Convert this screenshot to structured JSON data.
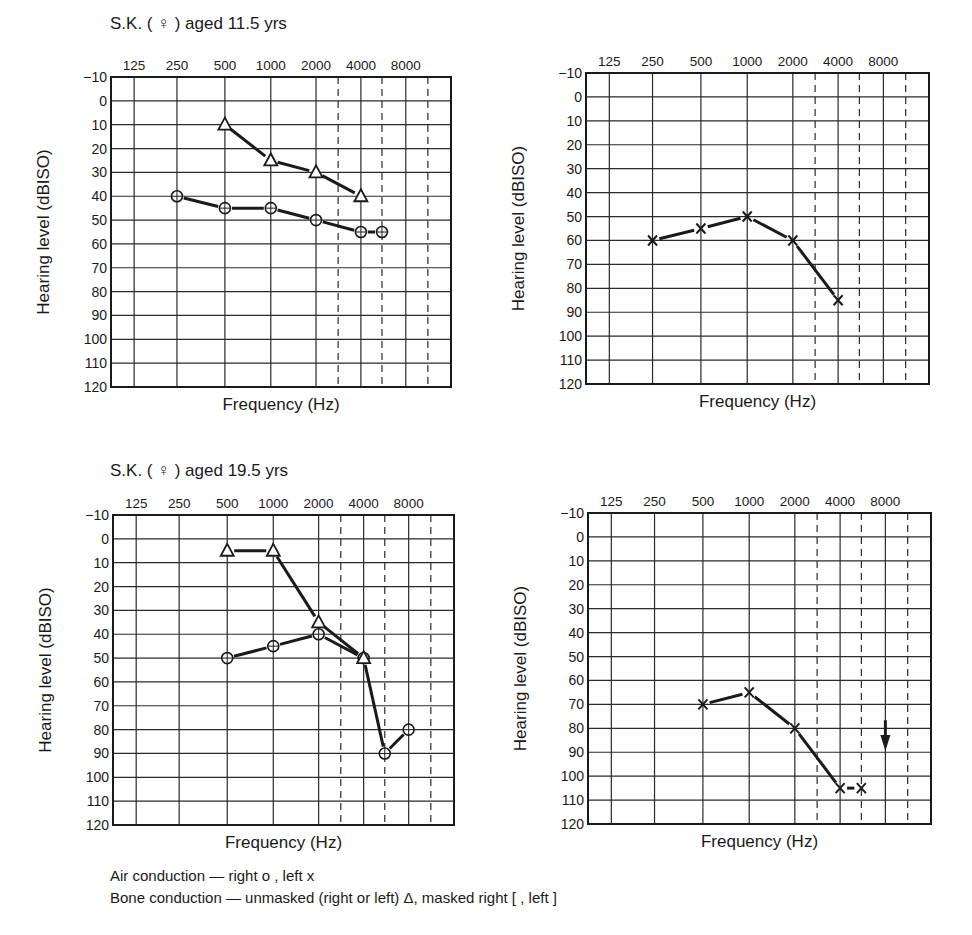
{
  "panels_title": {
    "top": "S.K. ( ♀ ) aged 11.5 yrs",
    "bottom": "S.K. ( ♀ ) aged 19.5 yrs"
  },
  "legend": {
    "air": "Air conduction — right ο , left x",
    "bone": "Bone conduction — unmasked (right or left) Δ, masked right [ , left ]"
  },
  "cutoff_text": "",
  "colors": {
    "ink": "#1a1a1a",
    "grid": "#2a2a2a",
    "background": "#ffffff"
  },
  "chart_data": [
    {
      "type": "line",
      "title": "S.K. (♀) aged 11.5 yrs — right ear",
      "xlabel": "Frequency (Hz)",
      "ylabel": "Hearing level (dBISO)",
      "x_tick_labels": [
        "125",
        "250",
        "500",
        "1000",
        "2000",
        "4000",
        "8000"
      ],
      "y_ticks": [
        -10,
        0,
        10,
        20,
        30,
        40,
        50,
        60,
        70,
        80,
        90,
        100,
        110,
        120
      ],
      "ylim": [
        -10,
        120
      ],
      "y_inverted": true,
      "grid": true,
      "series": [
        {
          "name": "Air conduction right (o)",
          "marker": "circle",
          "x": [
            250,
            500,
            1000,
            2000,
            4000,
            6000
          ],
          "values": [
            40,
            45,
            45,
            50,
            55,
            55
          ]
        },
        {
          "name": "Bone conduction unmasked (Δ)",
          "marker": "triangle",
          "x": [
            500,
            1000,
            2000,
            4000
          ],
          "values": [
            10,
            25,
            30,
            40
          ]
        }
      ]
    },
    {
      "type": "line",
      "title": "S.K. (♀) aged 11.5 yrs — left ear",
      "xlabel": "Frequency (Hz)",
      "ylabel": "Hearing level (dBISO)",
      "x_tick_labels": [
        "125",
        "250",
        "500",
        "1000",
        "2000",
        "4000",
        "8000"
      ],
      "y_ticks": [
        -10,
        0,
        10,
        20,
        30,
        40,
        50,
        60,
        70,
        80,
        90,
        100,
        110,
        120
      ],
      "ylim": [
        -10,
        120
      ],
      "y_inverted": true,
      "grid": true,
      "series": [
        {
          "name": "Air conduction left (x)",
          "marker": "x",
          "x": [
            250,
            500,
            1000,
            2000,
            4000
          ],
          "values": [
            60,
            55,
            50,
            60,
            85
          ]
        }
      ]
    },
    {
      "type": "line",
      "title": "S.K. (♀) aged 19.5 yrs — right ear",
      "xlabel": "Frequency (Hz)",
      "ylabel": "Hearing level (dBISO)",
      "x_tick_labels": [
        "125",
        "250",
        "500",
        "1000",
        "2000",
        "4000",
        "8000"
      ],
      "y_ticks": [
        -10,
        0,
        10,
        20,
        30,
        40,
        50,
        60,
        70,
        80,
        90,
        100,
        110,
        120
      ],
      "ylim": [
        -10,
        120
      ],
      "y_inverted": true,
      "grid": true,
      "series": [
        {
          "name": "Air conduction right (o)",
          "marker": "circle",
          "x": [
            500,
            1000,
            2000,
            4000,
            6000,
            8000
          ],
          "values": [
            50,
            45,
            40,
            50,
            90,
            80
          ]
        },
        {
          "name": "Bone conduction unmasked (Δ)",
          "marker": "triangle",
          "x": [
            500,
            1000,
            2000,
            4000
          ],
          "values": [
            5,
            5,
            35,
            50
          ]
        }
      ]
    },
    {
      "type": "line",
      "title": "S.K. (♀) aged 19.5 yrs — left ear",
      "xlabel": "Frequency (Hz)",
      "ylabel": "Hearing level (dBISO)",
      "x_tick_labels": [
        "125",
        "250",
        "500",
        "1000",
        "2000",
        "4000",
        "8000"
      ],
      "y_ticks": [
        -10,
        0,
        10,
        20,
        30,
        40,
        50,
        60,
        70,
        80,
        90,
        100,
        110,
        120
      ],
      "ylim": [
        -10,
        120
      ],
      "y_inverted": true,
      "grid": true,
      "series": [
        {
          "name": "Air conduction left (x)",
          "marker": "x",
          "x": [
            500,
            1000,
            2000,
            4000,
            6000
          ],
          "values": [
            70,
            65,
            80,
            105,
            105
          ]
        }
      ],
      "annotations": [
        {
          "type": "no-response-arrow",
          "x": 8000,
          "from": 80,
          "to": 87
        }
      ]
    }
  ]
}
